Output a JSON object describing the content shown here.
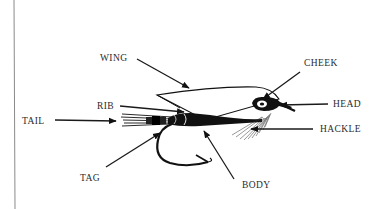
{
  "diagram": {
    "labels": {
      "wing": "WING",
      "cheek": "CHEEK",
      "head": "HEAD",
      "hackle": "HACKLE",
      "rib": "RIB",
      "tail": "TAIL",
      "tag": "TAG",
      "body": "BODY"
    },
    "colors": {
      "ink": "#111111",
      "text": "#2a2a2a",
      "background": "#ffffff",
      "rule": "#8a8a8a"
    }
  }
}
